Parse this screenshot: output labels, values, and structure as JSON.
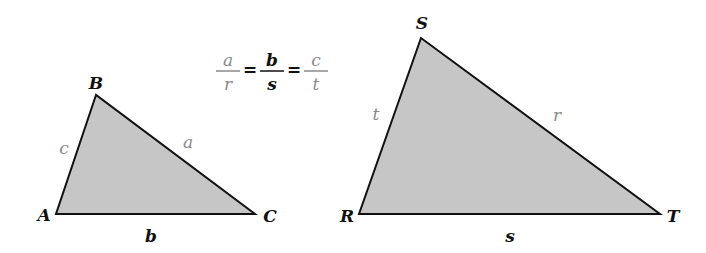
{
  "formula": {
    "fractions": [
      {
        "num": "a",
        "den": "r",
        "color": "#8a8a8a"
      },
      {
        "num": "b",
        "den": "s",
        "color": "#111111"
      },
      {
        "num": "c",
        "den": "t",
        "color": "#8a8a8a"
      }
    ],
    "eq": "="
  },
  "triangle_abc": {
    "vertices": {
      "A": "A",
      "B": "B",
      "C": "C"
    },
    "sides": {
      "a": "a",
      "b": "b",
      "c": "c"
    }
  },
  "triangle_rst": {
    "vertices": {
      "R": "R",
      "S": "S",
      "T": "T"
    },
    "sides": {
      "r": "r",
      "s": "s",
      "t": "t"
    }
  },
  "colors": {
    "fill": "#c6c6c6",
    "stroke": "#111111",
    "gray_label": "#8a8a8a"
  }
}
